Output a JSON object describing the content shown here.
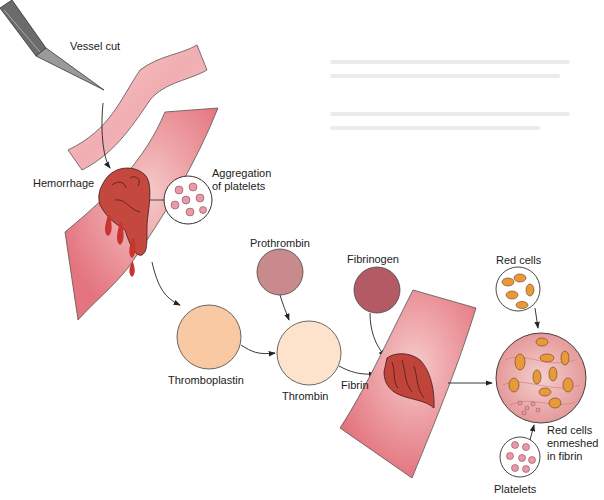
{
  "figure": {
    "labels": {
      "vessel_cut": "Vessel cut",
      "hemorrhage": "Hemorrhage",
      "aggregation": "Aggregation\nof platelets",
      "prothrombin": "Prothrombin",
      "fibrinogen": "Fibrinogen",
      "thromboplastin": "Thromboplastin",
      "thrombin": "Thrombin",
      "fibrin": "Fibrin",
      "red_cells": "Red cells",
      "enmeshed": "Red cells\nenmeshed\nin fibrin",
      "platelets": "Platelets"
    },
    "colors": {
      "vessel": "#e8808a",
      "vessel_light": "#f4c2c2",
      "clot": "#c0443a",
      "blood": "#c8342e",
      "prothrombin": "#c98a8e",
      "fibrinogen": "#b45a64",
      "thromboplastin": "#f9c9a4",
      "thrombin": "#fde3cc",
      "red_cell": "#e89a3a",
      "platelet": "#e89aa8"
    }
  }
}
